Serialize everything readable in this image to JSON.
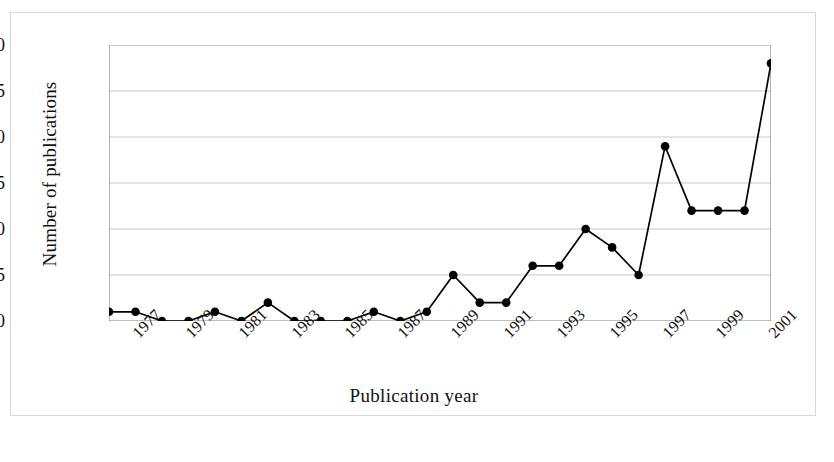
{
  "chart_data": {
    "type": "line",
    "title": "",
    "xlabel": "Publication year",
    "ylabel": "Number of publications",
    "x": [
      1976,
      1977,
      1978,
      1979,
      1980,
      1981,
      1982,
      1983,
      1984,
      1985,
      1986,
      1987,
      1988,
      1989,
      1990,
      1991,
      1992,
      1993,
      1994,
      1995,
      1996,
      1997,
      1998,
      1999,
      2000,
      2001
    ],
    "values": [
      1,
      1,
      0,
      0,
      1,
      0,
      2,
      0,
      0,
      0,
      1,
      0,
      1,
      5,
      2,
      2,
      6,
      6,
      10,
      8,
      5,
      19,
      12,
      12,
      12,
      28
    ],
    "series": [
      {
        "name": "Number of publications",
        "values": [
          1,
          1,
          0,
          0,
          1,
          0,
          2,
          0,
          0,
          0,
          1,
          0,
          1,
          5,
          2,
          2,
          6,
          6,
          10,
          8,
          5,
          19,
          12,
          12,
          12,
          28
        ]
      }
    ],
    "xlim": [
      1976,
      2001
    ],
    "ylim": [
      0,
      30
    ],
    "yticks": [
      0,
      5,
      10,
      15,
      20,
      25,
      30
    ],
    "ytick_labels": [
      "0",
      "5",
      "10",
      "15",
      "20",
      "25",
      "30"
    ],
    "xtick_labels": [
      "1977",
      "1979",
      "1981",
      "1983",
      "1985",
      "1987",
      "1989",
      "1991",
      "1993",
      "1995",
      "1997",
      "1999",
      "2001"
    ],
    "xtick_values": [
      1977,
      1979,
      1981,
      1983,
      1985,
      1987,
      1989,
      1991,
      1993,
      1995,
      1997,
      1999,
      2001
    ],
    "xtick_rotation": -45,
    "grid": "horizontal",
    "legend": "none",
    "marker": "filled-circle",
    "line_color": "#000000",
    "marker_color": "#000000",
    "grid_color": "#c8c8c8",
    "axis_color": "#808080",
    "background": "#ffffff",
    "border_color": "#d8d8d8"
  }
}
